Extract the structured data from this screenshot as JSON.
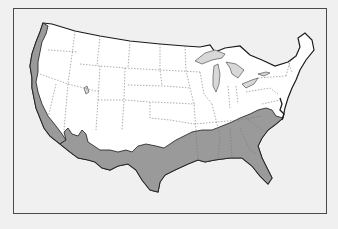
{
  "map": {
    "title": "",
    "subject": "Contiguous United States",
    "legend": [],
    "colors": {
      "background": "#f0f0f0",
      "land": "#ffffff",
      "shaded_region": "#9a9a9a",
      "lakes": "#d8d8d8",
      "state_borders": "#777777",
      "coastline": "#1a1a1a",
      "frame": "#4a4a4a"
    },
    "shaded_regions": [
      "Pacific coast (Washington, Oregon, California)",
      "Southern Arizona / New Mexico border",
      "Southern and eastern Texas",
      "Gulf Coast states (Louisiana, Mississippi, Alabama)",
      "Georgia, South Carolina, Florida",
      "Eastern North Carolina coastal plain",
      "Southern Arkansas"
    ]
  }
}
